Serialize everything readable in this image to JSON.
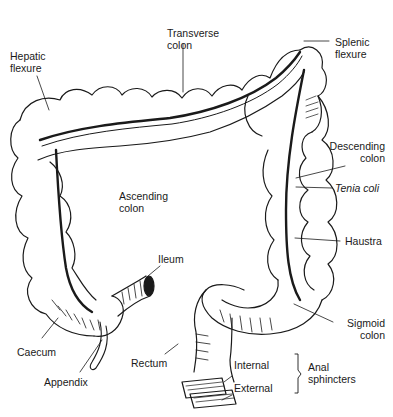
{
  "diagram": {
    "type": "anatomical-illustration",
    "labels": {
      "transverse_colon": [
        "Transverse",
        "colon"
      ],
      "hepatic_flexure": [
        "Hepatic",
        "flexure"
      ],
      "splenic_flexure": [
        "Splenic",
        "flexure"
      ],
      "descending_colon": [
        "Descending",
        "colon"
      ],
      "tenia_coli": "Tenia coli",
      "haustra": "Haustra",
      "ascending_colon": [
        "Ascending",
        "colon"
      ],
      "ileum": "Ileum",
      "caecum": "Caecum",
      "appendix": "Appendix",
      "rectum": "Rectum",
      "sigmoid_colon": [
        "Sigmoid",
        "colon"
      ],
      "internal": "Internal",
      "external": "External",
      "anal_sphincters": [
        "Anal",
        "sphincters"
      ]
    },
    "colors": {
      "ink": "#1a1a1a",
      "background": "#ffffff"
    }
  }
}
